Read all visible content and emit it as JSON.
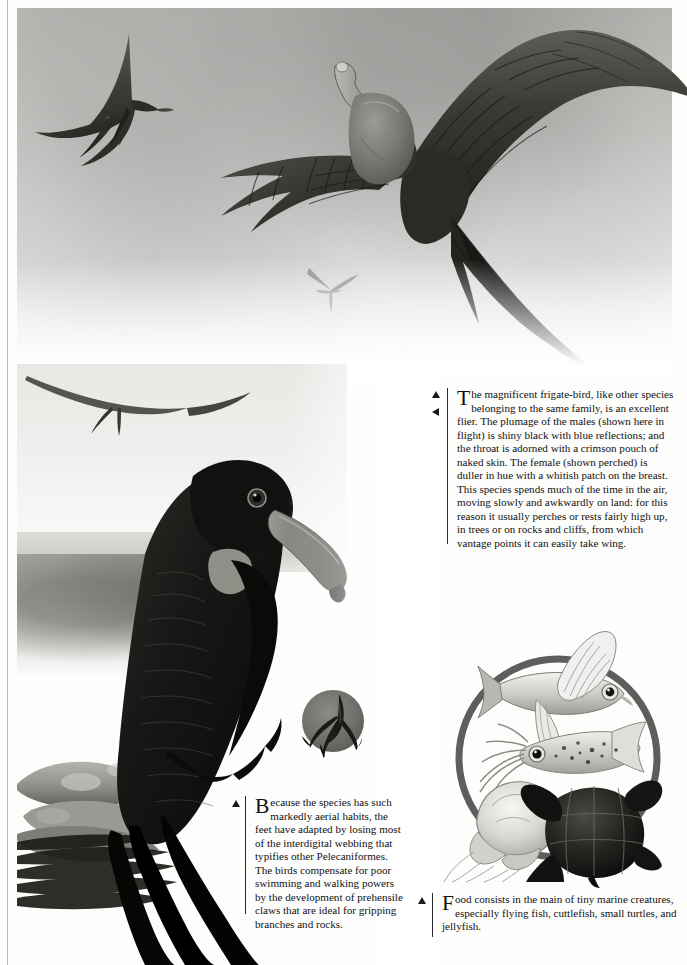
{
  "page": {
    "kind": "illustrated-encyclopedia-plate",
    "subject": "magnificent frigate-bird",
    "background_color": "#fdfdfc",
    "ink_color": "#111111",
    "rule_color": "#b9b9b4"
  },
  "captions": {
    "main": {
      "dropcap": "T",
      "text": "he magnificent frigate-bird, like other species belonging to the same family, is an excellent flier. The plumage of the males (shown here in flight) is shiny black with blue reflections; and the throat is adorned with a crimson pouch of naked skin. The female (shown perched) is duller in hue with a whitish patch on the breast. This species spends much of the time in the air, moving slowly and awkwardly on land: for this reason it usually perches or rests fairly high up, in trees or on rocks and cliffs, from which vantage points it can easily take wing.",
      "markers": [
        "triangle-up",
        "triangle-left"
      ]
    },
    "feet": {
      "dropcap": "B",
      "text": "ecause the species has such markedly aerial habits, the feet have adapted by losing most of the interdigital webbing that typifies other Pelecaniformes. The birds compensate for poor swimming and walking powers by the development of prehensile claws that are ideal for gripping branches and rocks.",
      "markers": [
        "triangle-up"
      ]
    },
    "food": {
      "dropcap": "F",
      "text": "ood consists in the main of tiny marine creatures, especially flying fish, cuttlefish, small turtles, and jellyfish.",
      "markers": [
        "triangle-up"
      ]
    }
  },
  "illustrations": {
    "sky_plate": {
      "name": "frigate-birds in flight over sky",
      "subjects": [
        "male frigate-bird in flight with inflated crimson throat pouch",
        "frigate-bird gliding upper left",
        "distant frigate-bird silhouette"
      ]
    },
    "perch_plate": {
      "name": "female frigate-bird perched on rocks",
      "subjects": [
        "perched female frigate-bird with whitish breast patch",
        "frigate-bird gliding above",
        "coastal rocks and vegetation",
        "sea horizon"
      ]
    },
    "foot_detail": {
      "name": "prehensile foot with reduced webbing",
      "shape": "circle",
      "disc_color": "#6e6e6c"
    },
    "food_detail": {
      "name": "prey items circle",
      "shape": "circle",
      "ring_color": "#5e5e5c",
      "items": [
        "flying fish",
        "cuttlefish",
        "jellyfish",
        "small turtle"
      ]
    }
  }
}
